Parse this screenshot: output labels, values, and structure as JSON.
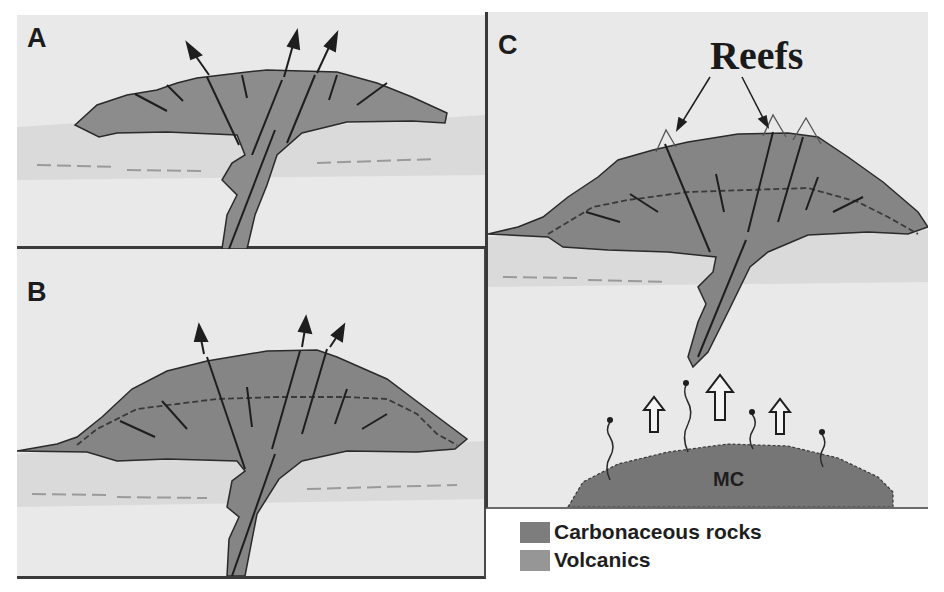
{
  "figure": {
    "panels": [
      {
        "id": "A",
        "label": "A"
      },
      {
        "id": "B",
        "label": "B"
      },
      {
        "id": "C",
        "label": "C",
        "annotation": "Reefs",
        "intrusion_label": "MC"
      }
    ],
    "legend": [
      {
        "label": "Carbonaceous rocks",
        "color": "#7d7d7d"
      },
      {
        "label": "Volcanics",
        "color": "#969696"
      }
    ],
    "colors": {
      "background": "#e9e9e9",
      "sediment": "#dcdcdc",
      "volcanic_body": "#8c8c8c",
      "carbonaceous_cap": "#808080",
      "intrusion": "#767676",
      "lines": "#1e1e1e"
    }
  }
}
